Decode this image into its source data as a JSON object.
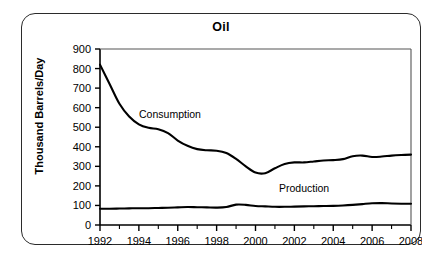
{
  "chart_data": {
    "type": "line",
    "title": "Oil",
    "xlabel": "",
    "ylabel": "Thousand Barrels/Day",
    "xlim": [
      1992,
      2008
    ],
    "ylim": [
      0,
      900
    ],
    "ytick_step": 100,
    "xtick_step": 2,
    "grid": false,
    "legend_position": "inline-annotations",
    "x_tick_labels": [
      "1992",
      "1994",
      "1996",
      "1998",
      "2000",
      "2002",
      "2004",
      "2006",
      "2008"
    ],
    "y_tick_labels": [
      "0",
      "100",
      "200",
      "300",
      "400",
      "500",
      "600",
      "700",
      "800",
      "900"
    ],
    "x": [
      1992,
      1992.5,
      1993,
      1993.5,
      1994,
      1994.5,
      1995,
      1995.5,
      1996,
      1996.5,
      1997,
      1997.5,
      1998,
      1998.5,
      1999,
      1999.5,
      2000,
      2000.5,
      2001,
      2001.5,
      2002,
      2002.5,
      2003,
      2003.5,
      2004,
      2004.5,
      2005,
      2005.5,
      2006,
      2006.5,
      2007,
      2007.5,
      2008
    ],
    "series": [
      {
        "name": "Consumption",
        "label_x": 1995.6,
        "label_y": 545,
        "values": [
          820,
          720,
          620,
          555,
          515,
          497,
          490,
          470,
          432,
          405,
          388,
          382,
          380,
          368,
          338,
          300,
          268,
          265,
          290,
          312,
          320,
          320,
          325,
          330,
          332,
          337,
          352,
          355,
          348,
          350,
          355,
          358,
          360
        ]
      },
      {
        "name": "Production",
        "label_x": 2002.5,
        "label_y": 168,
        "values": [
          83,
          83,
          84,
          85,
          86,
          86,
          87,
          88,
          90,
          92,
          91,
          90,
          89,
          92,
          104,
          103,
          97,
          95,
          93,
          93,
          94,
          95,
          96,
          97,
          98,
          100,
          103,
          107,
          111,
          112,
          110,
          109,
          109
        ]
      }
    ]
  }
}
